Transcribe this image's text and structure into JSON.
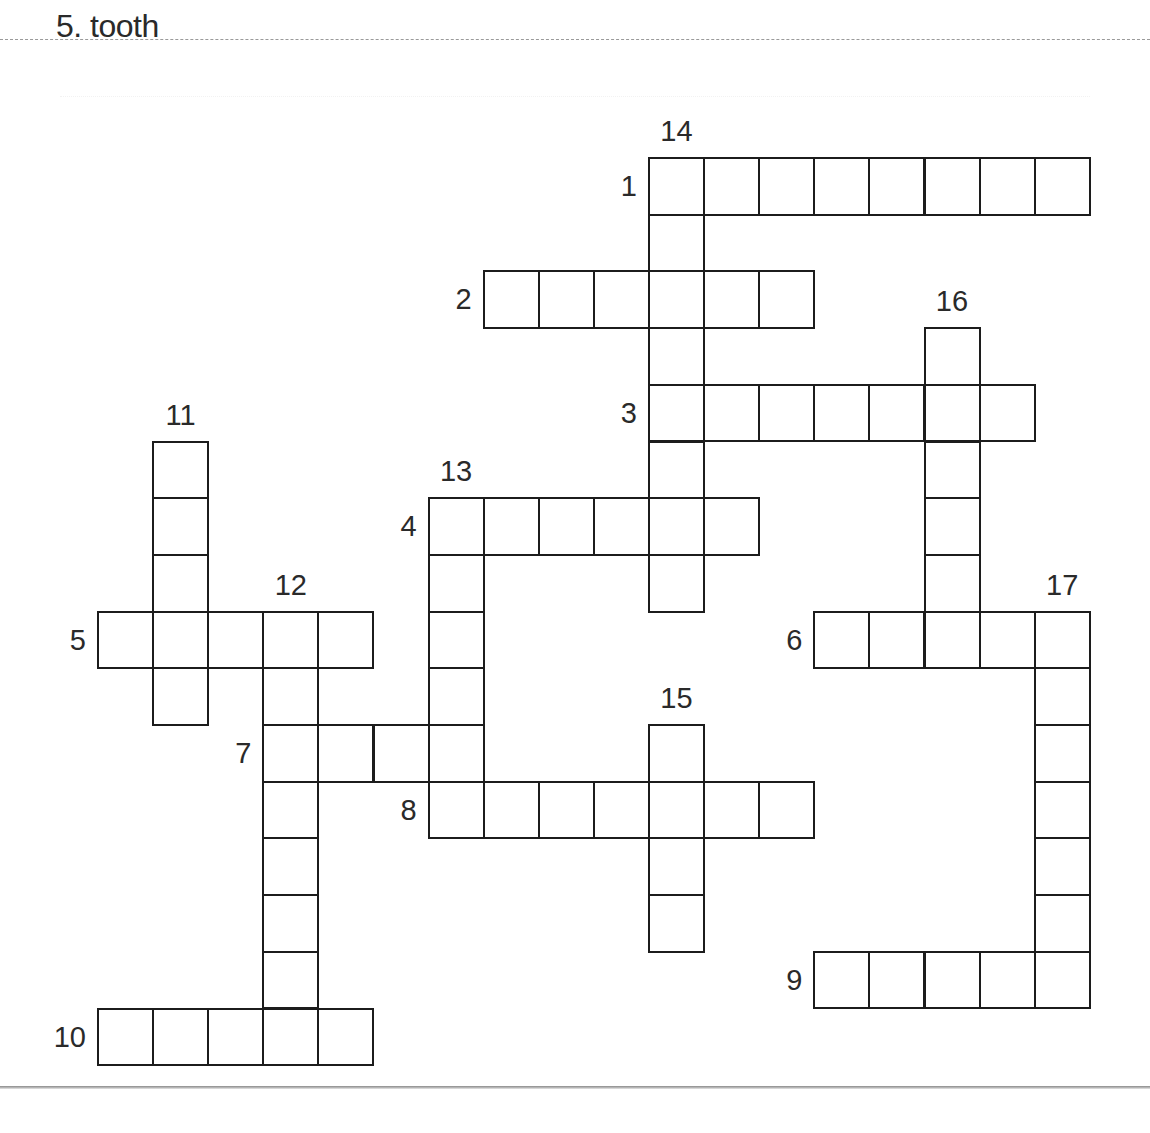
{
  "header": {
    "text": "5. tooth"
  },
  "grid": {
    "origin_x": 98,
    "origin_y": 158,
    "cell_w": 55.1,
    "cell_h": 56.7
  },
  "entries": [
    {
      "number": "1",
      "direction": "across",
      "row": 0,
      "col": 10,
      "length": 8
    },
    {
      "number": "2",
      "direction": "across",
      "row": 2,
      "col": 7,
      "length": 6
    },
    {
      "number": "3",
      "direction": "across",
      "row": 4,
      "col": 10,
      "length": 7
    },
    {
      "number": "4",
      "direction": "across",
      "row": 6,
      "col": 6,
      "length": 6
    },
    {
      "number": "5",
      "direction": "across",
      "row": 8,
      "col": 0,
      "length": 5
    },
    {
      "number": "6",
      "direction": "across",
      "row": 8,
      "col": 13,
      "length": 5
    },
    {
      "number": "7",
      "direction": "across",
      "row": 10,
      "col": 3,
      "length": 4
    },
    {
      "number": "8",
      "direction": "across",
      "row": 11,
      "col": 6,
      "length": 7
    },
    {
      "number": "9",
      "direction": "across",
      "row": 14,
      "col": 13,
      "length": 5
    },
    {
      "number": "10",
      "direction": "across",
      "row": 15,
      "col": 0,
      "length": 5
    },
    {
      "number": "11",
      "direction": "down",
      "row": 5,
      "col": 1,
      "length": 5
    },
    {
      "number": "12",
      "direction": "down",
      "row": 8,
      "col": 3,
      "length": 8
    },
    {
      "number": "13",
      "direction": "down",
      "row": 6,
      "col": 6,
      "length": 6
    },
    {
      "number": "14",
      "direction": "down",
      "row": 0,
      "col": 10,
      "length": 8
    },
    {
      "number": "15",
      "direction": "down",
      "row": 10,
      "col": 10,
      "length": 4
    },
    {
      "number": "16",
      "direction": "down",
      "row": 3,
      "col": 15,
      "length": 6
    },
    {
      "number": "17",
      "direction": "down",
      "row": 8,
      "col": 17,
      "length": 7
    }
  ]
}
